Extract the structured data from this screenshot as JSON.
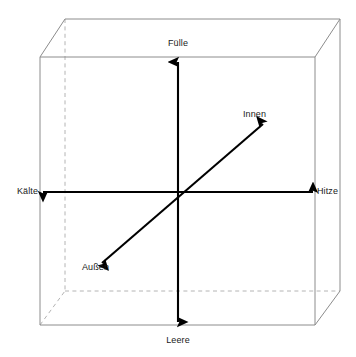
{
  "diagram": {
    "type": "3d-axis-cube",
    "background_color": "#ffffff",
    "cube": {
      "visible_edge_color": "#8c8c8c",
      "hidden_edge_color": "#b4b4b4",
      "hidden_edge_style": "dashed",
      "front_face": {
        "left": 40,
        "top": 57,
        "right": 315,
        "bottom": 325
      },
      "depth_offset": {
        "x": 25,
        "y": -38
      }
    },
    "origin": {
      "x": 178,
      "y": 192
    },
    "axes": [
      {
        "name": "vertical-axis",
        "color": "#000000",
        "positive_label": "Fülle",
        "negative_label": "Leere",
        "positive_tip": {
          "x": 178,
          "y": 62
        },
        "negative_tip": {
          "x": 178,
          "y": 322
        }
      },
      {
        "name": "horizontal-axis",
        "color": "#000000",
        "positive_label": "Hitze",
        "negative_label": "Kälte",
        "positive_tip": {
          "x": 313,
          "y": 192
        },
        "negative_tip": {
          "x": 43,
          "y": 192
        }
      },
      {
        "name": "diagonal-axis",
        "color": "#000000",
        "positive_label": "Innen",
        "negative_label": "Außen",
        "positive_tip": {
          "x": 263,
          "y": 124
        },
        "negative_tip": {
          "x": 102,
          "y": 263
        }
      }
    ],
    "labels": {
      "top": "Fülle",
      "bottom": "Leere",
      "left": "Kälte",
      "right": "Hitze",
      "upper_right": "Innen",
      "lower_left": "Außen"
    }
  }
}
